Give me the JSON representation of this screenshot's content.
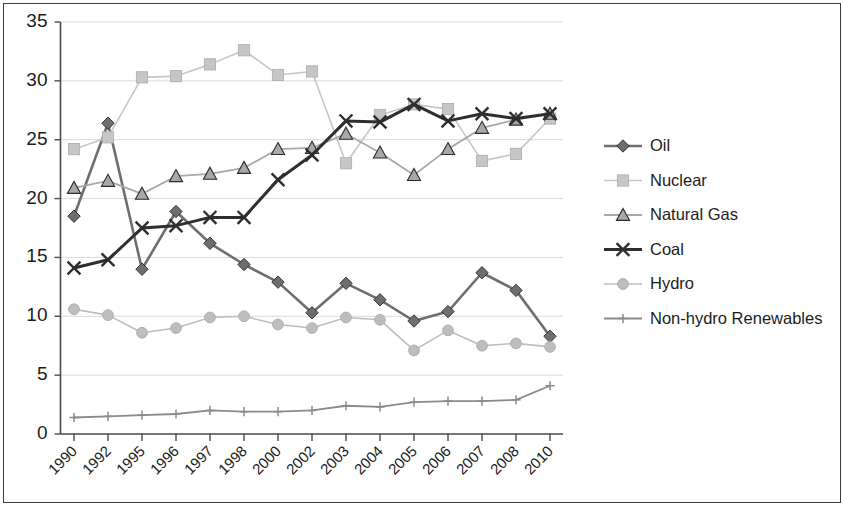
{
  "chart_data": {
    "type": "line",
    "title": "",
    "subtitle": "",
    "xlabel": "",
    "ylabel": "",
    "categories": [
      "1990",
      "1992",
      "1995",
      "1996",
      "1997",
      "1998",
      "2000",
      "2002",
      "2003",
      "2004",
      "2005",
      "2006",
      "2007",
      "2008",
      "2010"
    ],
    "ylim": [
      0,
      35
    ],
    "yticks": [
      0,
      5,
      10,
      15,
      20,
      25,
      30,
      35
    ],
    "ytick_labels": [
      "0",
      "5",
      "10",
      "15",
      "20",
      "25",
      "30",
      "35"
    ],
    "grid": true,
    "grid_axis": "y",
    "legend_position": "right",
    "series": [
      {
        "name": "Oil",
        "marker": "diamond",
        "color": "#6e6e6e",
        "values": [
          18.5,
          26.4,
          14.0,
          18.9,
          16.2,
          14.4,
          12.9,
          10.3,
          12.8,
          11.4,
          9.6,
          10.4,
          13.7,
          12.2,
          8.3
        ]
      },
      {
        "name": "Nuclear",
        "marker": "square",
        "color": "#c6c6c6",
        "values": [
          24.2,
          25.2,
          30.3,
          30.4,
          31.4,
          32.6,
          30.5,
          30.8,
          23.0,
          27.1,
          28.0,
          27.6,
          23.2,
          23.8,
          26.8
        ]
      },
      {
        "name": "Natural Gas",
        "marker": "triangle",
        "color": "#a8a8a8",
        "values": [
          20.9,
          21.5,
          20.4,
          21.9,
          22.1,
          22.6,
          24.2,
          24.3,
          25.5,
          23.9,
          22.0,
          24.2,
          26.0,
          26.7,
          27.2
        ]
      },
      {
        "name": "Coal",
        "marker": "cross",
        "color": "#2e2e2e",
        "values": [
          14.1,
          14.8,
          17.5,
          17.7,
          18.4,
          18.4,
          21.6,
          23.7,
          26.6,
          26.5,
          28.0,
          26.6,
          27.2,
          26.8,
          27.2
        ]
      },
      {
        "name": "Hydro",
        "marker": "circle",
        "color": "#bdbdbd",
        "values": [
          10.6,
          10.1,
          8.6,
          9.0,
          9.9,
          10.0,
          9.3,
          9.0,
          9.9,
          9.7,
          7.1,
          8.8,
          7.5,
          7.7,
          7.4
        ]
      },
      {
        "name": "Non-hydro Renewables",
        "marker": "plus",
        "color": "#8a8a8a",
        "values": [
          1.4,
          1.5,
          1.6,
          1.7,
          2.0,
          1.9,
          1.9,
          2.0,
          2.4,
          2.3,
          2.7,
          2.8,
          2.8,
          2.9,
          4.1
        ]
      }
    ]
  },
  "legend": {
    "items": [
      {
        "label": "Oil"
      },
      {
        "label": "Nuclear"
      },
      {
        "label": "Natural Gas"
      },
      {
        "label": "Coal"
      },
      {
        "label": "Hydro"
      },
      {
        "label": "Non-hydro Renewables"
      }
    ]
  },
  "axes": {
    "y_labels": [
      "35",
      "30",
      "25",
      "20",
      "15",
      "10",
      "5",
      "0"
    ],
    "x_labels": [
      "1990",
      "1992",
      "1995",
      "1996",
      "1997",
      "1998",
      "2000",
      "2002",
      "2003",
      "2004",
      "2005",
      "2006",
      "2007",
      "2008",
      "2010"
    ]
  }
}
